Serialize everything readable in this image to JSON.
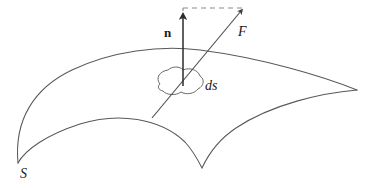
{
  "figure": {
    "type": "vector-field-through-surface-diagram",
    "background_color": "#ffffff",
    "stroke_color": "#4a4a4a",
    "arrow_color": "#2b2b2b",
    "width": 367,
    "height": 188,
    "labels": {
      "normal_vector": "n",
      "force_vector": "F",
      "area_element": "ds",
      "surface": "S"
    },
    "elements": {
      "surface_name": "curved surface band S",
      "normal_arrow_name": "unit normal vector n",
      "force_arrow_name": "force vector F",
      "patch_name": "infinitesimal area element ds",
      "dashed_connector_name": "dashed projection line from n tip to F tip"
    },
    "geometry": {
      "normal_arrow": {
        "x1": 183,
        "y1": 82,
        "x2": 183,
        "y2": 12
      },
      "force_arrow": {
        "x1": 152,
        "y1": 118,
        "x2": 243,
        "y2": 9
      },
      "dashed_line": {
        "x1": 183,
        "y1": 8,
        "x2": 242,
        "y2": 8
      },
      "ds_center": {
        "x": 180,
        "y": 82
      },
      "surface_right_tip": {
        "x": 357,
        "y": 90
      },
      "surface_left_cusp": {
        "x": 18,
        "y": 163
      },
      "surface_bottom_cusp": {
        "x": 202,
        "y": 168
      }
    }
  }
}
